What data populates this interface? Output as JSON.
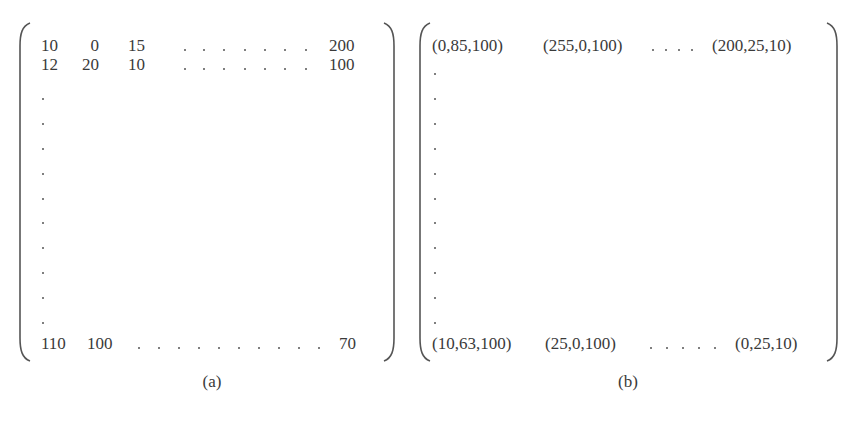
{
  "figure": {
    "panels": [
      {
        "id": "a",
        "caption": "(a)",
        "rows": {
          "row1": [
            "10",
            "0",
            "15",
            "200"
          ],
          "row2": [
            "12",
            "20",
            "10",
            "100"
          ],
          "last": [
            "110",
            "100",
            "70"
          ]
        },
        "row1_horizontal_dots": 7,
        "row2_horizontal_dots": 7,
        "last_row_horizontal_dots": 10,
        "vertical_dots": 10
      },
      {
        "id": "b",
        "caption": "(b)",
        "rows": {
          "row1": [
            "(0,85,100)",
            "(255,0,100)",
            "(200,25,10)"
          ],
          "last": [
            "(10,63,100)",
            "(25,0,100)",
            "(0,25,10)"
          ]
        },
        "row1_horizontal_dots": 4,
        "last_row_horizontal_dots": 5,
        "vertical_dots": 11
      }
    ]
  }
}
